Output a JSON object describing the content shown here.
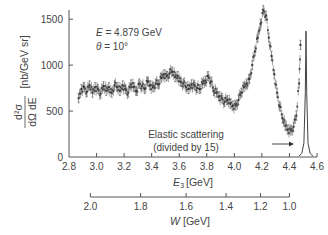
{
  "chart_data": {
    "type": "scatter",
    "title": "",
    "xlabel_main": "E",
    "xlabel_sub": "3",
    "xlabel_unit": "[GeV]",
    "x2label_main": "W",
    "x2label_unit": "[GeV]",
    "ylabel_num": "d²σ",
    "ylabel_den": "dΩ dE",
    "ylabel_unit": "[nb/GeV sr]",
    "xlim": [
      2.8,
      4.6
    ],
    "ylim": [
      0,
      1600
    ],
    "xticks": [
      2.8,
      3.0,
      3.2,
      3.4,
      3.6,
      3.8,
      4.0,
      4.2,
      4.4,
      4.6
    ],
    "xtick_labels": [
      "2.8",
      "3.0",
      "3.2",
      "3.4",
      "3.6",
      "3.8",
      "4.0",
      "4.2",
      "4.4",
      "4.6"
    ],
    "yticks": [
      0,
      500,
      1000,
      1500
    ],
    "ytick_labels": [
      "0",
      "500",
      "1000",
      "1500"
    ],
    "w_axis": {
      "ticks": [
        {
          "w": 2.0,
          "e3": 2.955
        },
        {
          "w": 1.8,
          "e3": 3.32
        },
        {
          "w": 1.6,
          "e3": 3.65
        },
        {
          "w": 1.4,
          "e3": 3.94
        },
        {
          "w": 1.2,
          "e3": 4.19
        },
        {
          "w": 1.0,
          "e3": 4.4
        }
      ],
      "tick_labels": [
        "2.0",
        "1.8",
        "1.6",
        "1.4",
        "1.2",
        "1.0"
      ]
    },
    "annotations": {
      "energy": "E = 4.879 GeV",
      "energy_var": "E",
      "energy_val": " = 4.879 GeV",
      "angle_var": "θ",
      "angle_val": " = 10°",
      "elastic_line1": "Elastic scattering",
      "elastic_line2": "(divided by 15)"
    },
    "series": [
      {
        "name": "inelastic cross section",
        "x": [
          2.87,
          2.89,
          2.91,
          2.93,
          2.95,
          2.97,
          2.99,
          3.01,
          3.03,
          3.05,
          3.07,
          3.09,
          3.11,
          3.13,
          3.15,
          3.17,
          3.19,
          3.21,
          3.23,
          3.25,
          3.27,
          3.29,
          3.31,
          3.33,
          3.35,
          3.37,
          3.39,
          3.41,
          3.43,
          3.45,
          3.47,
          3.49,
          3.51,
          3.53,
          3.55,
          3.57,
          3.59,
          3.61,
          3.63,
          3.65,
          3.67,
          3.69,
          3.71,
          3.73,
          3.75,
          3.77,
          3.79,
          3.81,
          3.83,
          3.85,
          3.87,
          3.89,
          3.91,
          3.93,
          3.95,
          3.97,
          3.99,
          4.01,
          4.03,
          4.05,
          4.07,
          4.09,
          4.11,
          4.13,
          4.15,
          4.17,
          4.19,
          4.21,
          4.23,
          4.25,
          4.27,
          4.29,
          4.31,
          4.33,
          4.35,
          4.37,
          4.39,
          4.41,
          4.43,
          4.45,
          4.47,
          4.48
        ],
        "y": [
          640,
          740,
          760,
          710,
          780,
          700,
          760,
          740,
          690,
          770,
          720,
          760,
          700,
          780,
          760,
          720,
          780,
          740,
          700,
          790,
          760,
          720,
          800,
          770,
          740,
          820,
          780,
          760,
          800,
          790,
          860,
          900,
          880,
          910,
          930,
          870,
          880,
          820,
          800,
          760,
          740,
          790,
          780,
          750,
          740,
          800,
          830,
          880,
          820,
          720,
          700,
          660,
          640,
          600,
          620,
          580,
          560,
          560,
          620,
          700,
          760,
          800,
          850,
          1000,
          1150,
          1300,
          1450,
          1600,
          1540,
          1300,
          1100,
          900,
          700,
          550,
          420,
          340,
          300,
          290,
          330,
          450,
          800,
          1220
        ],
        "yerr": 50
      },
      {
        "name": "elastic peak (divided by 15)",
        "x": [
          4.47,
          4.49,
          4.505,
          4.515,
          4.52,
          4.525,
          4.535,
          4.55,
          4.57
        ],
        "y": [
          10,
          40,
          150,
          700,
          1370,
          700,
          150,
          40,
          10
        ]
      }
    ]
  }
}
